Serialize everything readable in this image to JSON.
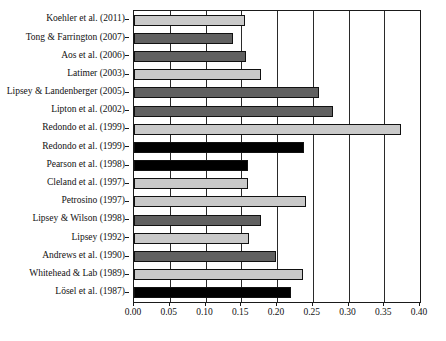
{
  "chart_data": {
    "type": "bar",
    "orientation": "horizontal",
    "title": "",
    "subtitle": "",
    "xlabel": "",
    "ylabel": "",
    "xlim": [
      0.0,
      0.4
    ],
    "xticks": [
      "0.00",
      "0.05",
      "0.10",
      "0.15",
      "0.20",
      "0.25",
      "0.30",
      "0.35",
      "0.40"
    ],
    "xtick_values": [
      0.0,
      0.05,
      0.1,
      0.15,
      0.2,
      0.25,
      0.3,
      0.35,
      0.4
    ],
    "grid": "vertical",
    "legend": "none",
    "categories": [
      "Koehler et al. (2011)",
      "Tong & Farrington (2007)",
      "Aos et al. (2006)",
      "Latimer (2003)",
      "Lipsey & Landenberger (2005)",
      "Lipton et al. (2002)",
      "Redondo et al. (1999)",
      "Redondo et al. (1999)",
      "Pearson et al. (1998)",
      "Cleland et al. (1997)",
      "Petrosino (1997)",
      "Lipsey & Wilson (1998)",
      "Lipsey (1992)",
      "Andrews et al. (1990)",
      "Whitehead & Lab (1989)",
      "Lösel et al. (1987)"
    ],
    "values": [
      0.155,
      0.138,
      0.157,
      0.178,
      0.259,
      0.278,
      0.373,
      0.238,
      0.159,
      0.159,
      0.241,
      0.178,
      0.161,
      0.199,
      0.236,
      0.22
    ],
    "shades": [
      "light",
      "dark",
      "dark",
      "light",
      "dark",
      "dark",
      "light",
      "black",
      "black",
      "light",
      "light",
      "dark",
      "light",
      "dark",
      "light",
      "black"
    ]
  },
  "colors": {
    "shade_light": "#c9c9c9",
    "shade_dark": "#616161",
    "shade_black": "#000000",
    "axis": "#1a1a1a",
    "grid": "#2a2a2a",
    "background": "#ffffff"
  }
}
